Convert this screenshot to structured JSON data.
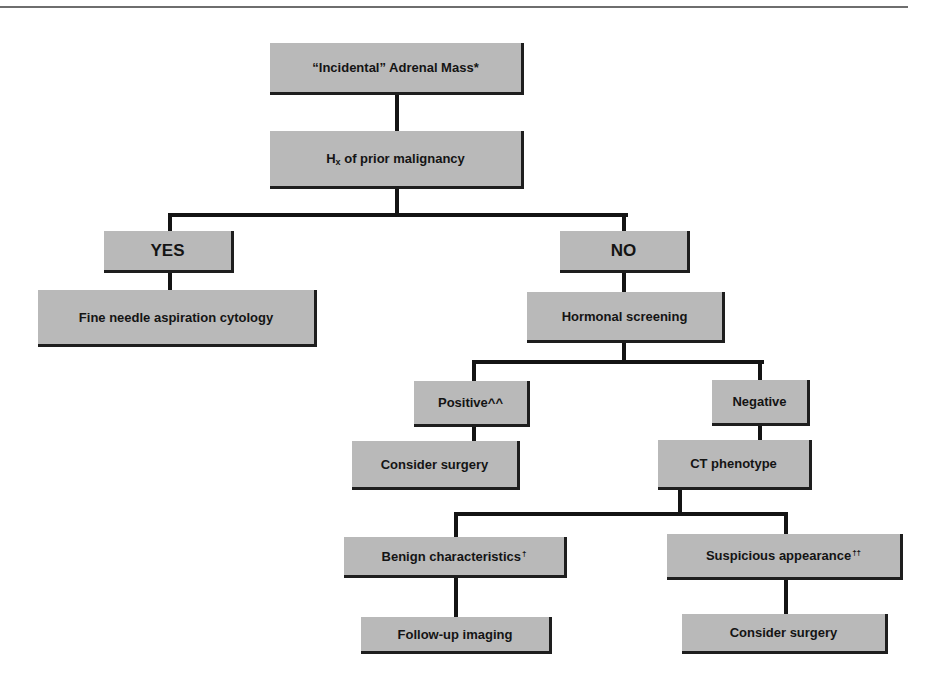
{
  "diagram": {
    "type": "flowchart",
    "nodes": {
      "root": {
        "label": "“Incidental” Adrenal Mass*"
      },
      "history": {
        "prefix": "H",
        "sub": "x",
        "label": " of prior malignancy"
      },
      "yes": {
        "label": "YES"
      },
      "no": {
        "label": "NO"
      },
      "fna": {
        "label": "Fine needle aspiration cytology"
      },
      "hormonal": {
        "label": "Hormonal screening"
      },
      "positive": {
        "label": "Positive^^"
      },
      "negative": {
        "label": "Negative"
      },
      "surgery1": {
        "label": "Consider surgery"
      },
      "ct": {
        "label": "CT phenotype"
      },
      "benign": {
        "label": "Benign characteristics",
        "mark": "†"
      },
      "suspicious": {
        "label": "Suspicious appearance",
        "mark": "††"
      },
      "followup": {
        "label": "Follow-up imaging"
      },
      "surgery2": {
        "label": "Consider surgery"
      }
    },
    "edges": [
      [
        "root",
        "history"
      ],
      [
        "history",
        "yes"
      ],
      [
        "history",
        "no"
      ],
      [
        "yes",
        "fna"
      ],
      [
        "no",
        "hormonal"
      ],
      [
        "hormonal",
        "positive"
      ],
      [
        "hormonal",
        "negative"
      ],
      [
        "positive",
        "surgery1"
      ],
      [
        "negative",
        "ct"
      ],
      [
        "ct",
        "benign"
      ],
      [
        "ct",
        "suspicious"
      ],
      [
        "benign",
        "followup"
      ],
      [
        "suspicious",
        "surgery2"
      ]
    ],
    "colors": {
      "box_fill": "#b9b9b9",
      "line": "#141414",
      "shadow": "#1e1e1e"
    }
  }
}
